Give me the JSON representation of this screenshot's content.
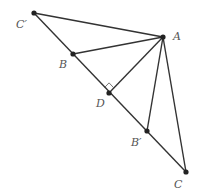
{
  "diagram": {
    "type": "geometry",
    "points": {
      "A": {
        "label": "A",
        "x": 163,
        "y": 37,
        "lx": 173,
        "ly": 40
      },
      "B": {
        "label": "B",
        "x": 73,
        "y": 54,
        "lx": 59,
        "ly": 68
      },
      "C": {
        "label": "C",
        "x": 186,
        "y": 172,
        "lx": 174,
        "ly": 188
      },
      "D": {
        "label": "D",
        "x": 109,
        "y": 93,
        "lx": 96,
        "ly": 107
      },
      "Bp": {
        "label": "B′",
        "x": 147,
        "y": 131,
        "lx": 131,
        "ly": 146
      },
      "Cp": {
        "label": "C′",
        "x": 34,
        "y": 13,
        "lx": 16,
        "ly": 28
      }
    },
    "segments": [
      [
        "Cp",
        "C"
      ],
      [
        "Cp",
        "A"
      ],
      [
        "A",
        "B"
      ],
      [
        "A",
        "D"
      ],
      [
        "A",
        "Bp"
      ],
      [
        "A",
        "C"
      ]
    ],
    "right_angle_at": "D",
    "colors": {
      "line": "#333333",
      "point": "#222222",
      "label": "#555555"
    }
  }
}
